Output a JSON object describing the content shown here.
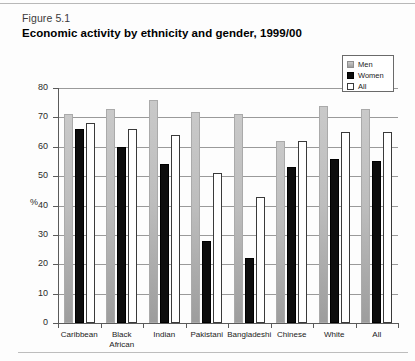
{
  "figure": {
    "number": "Figure 5.1",
    "title": "Economic activity by ethnicity and gender, 1999/00"
  },
  "legend": {
    "position": "top-right",
    "items": [
      {
        "label": "Men",
        "swatch": "men-swatch",
        "color": "#bdbdbd"
      },
      {
        "label": "Women",
        "swatch": "women-swatch",
        "color": "#0d0d0d"
      },
      {
        "label": "All",
        "swatch": "all-swatch",
        "color": "#ffffff"
      }
    ]
  },
  "axes": {
    "ylabel": "%",
    "yticks": [
      "0",
      "10",
      "20",
      "30",
      "40",
      "50",
      "60",
      "70",
      "80"
    ],
    "xlabel": ""
  },
  "footer": {
    "note": ""
  },
  "chart_data": {
    "type": "bar",
    "title": "Economic activity by ethnicity and gender, 1999/00",
    "xlabel": "",
    "ylabel": "%",
    "ylim": [
      0,
      80
    ],
    "ytick_step": 10,
    "grid": true,
    "legend_position": "top-right",
    "categories": [
      "Caribbean",
      "Black African",
      "Indian",
      "Pakistani",
      "Bangladeshi",
      "Chinese",
      "White",
      "All"
    ],
    "category_lines": [
      [
        "Caribbean"
      ],
      [
        "Black",
        "African"
      ],
      [
        "Indian"
      ],
      [
        "Pakistani"
      ],
      [
        "Bangladeshi"
      ],
      [
        "Chinese"
      ],
      [
        "White"
      ],
      [
        "All"
      ]
    ],
    "series": [
      {
        "name": "Men",
        "color": "#bdbdbd",
        "values": [
          71,
          73,
          76,
          72,
          71,
          62,
          74,
          73
        ]
      },
      {
        "name": "Women",
        "color": "#0d0d0d",
        "values": [
          66,
          60,
          54,
          28,
          22,
          53,
          56,
          55
        ]
      },
      {
        "name": "All",
        "color": "#ffffff",
        "values": [
          68,
          66,
          64,
          51,
          43,
          62,
          65,
          65
        ]
      }
    ]
  }
}
